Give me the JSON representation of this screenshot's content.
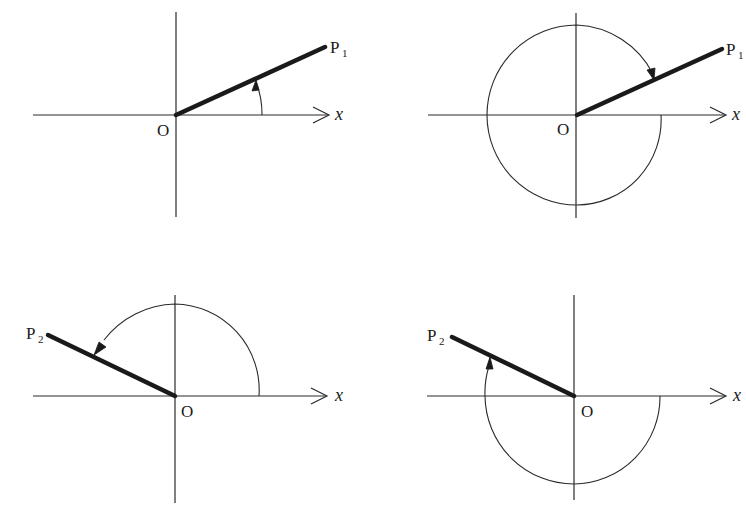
{
  "figure": {
    "colors": {
      "line": "#1a1a1a",
      "background": "#ffffff"
    },
    "panels": [
      {
        "id": "top-left",
        "origin_label": "O",
        "axis_label": "x",
        "point_label": "P",
        "point_subscript": "1",
        "rotation": "counterclockwise, small positive angle (about 27°)",
        "arc_type": "short arc from x-axis to ray"
      },
      {
        "id": "top-right",
        "origin_label": "O",
        "axis_label": "x",
        "point_label": "P",
        "point_subscript": "1",
        "rotation": "clockwise, negative angle (about -333°)",
        "arc_type": "nearly full-circle spiral arc ending at ray"
      },
      {
        "id": "bottom-left",
        "origin_label": "O",
        "axis_label": "x",
        "point_label": "P",
        "point_subscript": "2",
        "rotation": "counterclockwise, positive angle (about 153°)",
        "arc_type": "upper arc from positive x-axis to ray"
      },
      {
        "id": "bottom-right",
        "origin_label": "O",
        "axis_label": "x",
        "point_label": "P",
        "point_subscript": "2",
        "rotation": "clockwise, negative angle (about -207°)",
        "arc_type": "lower arc from positive x-axis around to ray"
      }
    ]
  }
}
